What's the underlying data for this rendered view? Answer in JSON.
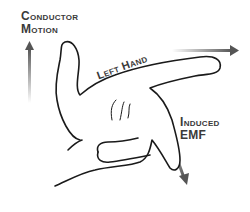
{
  "diagram": {
    "labels": {
      "conductor_motion_line1": "Conductor",
      "conductor_motion_line2": "Motion",
      "hand": "Left Hand",
      "induced_emf_line1": "Induced",
      "induced_emf_line2": "EMF"
    },
    "arrows": [
      {
        "name": "conductor-motion-arrow",
        "direction": "up"
      },
      {
        "name": "field-arrow",
        "direction": "right"
      },
      {
        "name": "induced-emf-arrow",
        "direction": "down-right"
      }
    ],
    "colors": {
      "outline": "#1a1a1a",
      "text": "#3a3a3a",
      "arrow_dark": "#555555",
      "arrow_light": "#e0e0e0",
      "background": "#ffffff"
    }
  }
}
